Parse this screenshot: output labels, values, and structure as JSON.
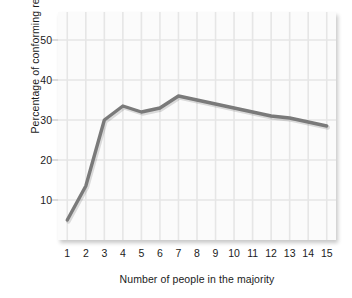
{
  "chart_data": {
    "type": "line",
    "title": "",
    "xlabel": "Number of people in the majority",
    "ylabel": "Percentage of conforming responses",
    "x": [
      1,
      2,
      3,
      4,
      5,
      6,
      7,
      8,
      9,
      10,
      11,
      12,
      13,
      14,
      15
    ],
    "values": [
      5,
      13.5,
      30,
      33.5,
      32,
      33,
      36,
      35,
      34,
      33,
      32,
      31,
      30.5,
      29.5,
      28.5
    ],
    "series": [
      {
        "name": "Conforming responses",
        "values": [
          5,
          13.5,
          30,
          33.5,
          32,
          33,
          36,
          35,
          34,
          33,
          32,
          31,
          30.5,
          29.5,
          28.5
        ]
      }
    ],
    "xtick_labels": [
      "1",
      "2",
      "3",
      "4",
      "5",
      "6",
      "7",
      "8",
      "9",
      "10",
      "11",
      "12",
      "13",
      "14",
      "15"
    ],
    "ytick_labels": [
      "10",
      "20",
      "30",
      "40",
      "50"
    ],
    "ytick_values": [
      10,
      20,
      30,
      40,
      50
    ],
    "xlim": [
      0.5,
      15.5
    ],
    "ylim": [
      0,
      57
    ],
    "grid": true,
    "legend": "none",
    "line_color": "#7a7a7a",
    "grid_color": "#e6e6e6",
    "plot_background": "#fbfbfb",
    "text_color": "#1b1b1b"
  }
}
